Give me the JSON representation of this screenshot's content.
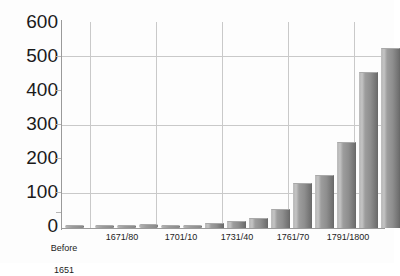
{
  "chart_data": {
    "type": "bar",
    "title": "",
    "subtitle": "",
    "xlabel": "",
    "ylabel": "",
    "ylim": [
      0,
      600
    ],
    "ytick_labels": [
      "0",
      "100",
      "200",
      "300",
      "400",
      "500",
      "600"
    ],
    "ytick_values": [
      0,
      100,
      200,
      300,
      400,
      500,
      600
    ],
    "grid": "horizontal-major-and-vertical-group-separators",
    "legend": "none",
    "categories": [
      "Before 1651",
      "",
      "1671/80",
      "",
      "",
      "1701/10",
      "",
      "",
      "1731/40",
      "",
      "",
      "1761/70",
      "",
      "",
      "1791/1800"
    ],
    "group_labels": [
      "Before\n1651",
      "1671/80",
      "1701/10",
      "1731/40",
      "1761/70",
      "1791/1800"
    ],
    "values": [
      5,
      8,
      10,
      12,
      8,
      10,
      15,
      20,
      30,
      55,
      130,
      155,
      250,
      455,
      525
    ],
    "bars": [
      {
        "label": "Before 1651",
        "value": 5
      },
      {
        "label": "1661/70",
        "value": 8
      },
      {
        "label": "1671/80",
        "value": 10
      },
      {
        "label": "1681/90",
        "value": 12
      },
      {
        "label": "1691/1700",
        "value": 8
      },
      {
        "label": "1701/10",
        "value": 10
      },
      {
        "label": "1711/20",
        "value": 15
      },
      {
        "label": "1721/30",
        "value": 20
      },
      {
        "label": "1731/40",
        "value": 30
      },
      {
        "label": "1741/50",
        "value": 55
      },
      {
        "label": "1751/60",
        "value": 130
      },
      {
        "label": "1761/70",
        "value": 155
      },
      {
        "label": "1771/80",
        "value": 250
      },
      {
        "label": "1781/90",
        "value": 455
      },
      {
        "label": "1791/1800",
        "value": 525
      }
    ],
    "bar_color": "#8e8e8e",
    "bar_highlight_color": "#c4c4c4",
    "bar_shadow_color": "#6e6e6e",
    "grid_color": "#c9c9c9",
    "axis_color": "#9a9a9a",
    "text_color": "#1a1a1a",
    "background_color": "#fdfdfd"
  },
  "y_axis": {
    "labels": [
      {
        "text": "600"
      },
      {
        "text": "500"
      },
      {
        "text": "400"
      },
      {
        "text": "300"
      },
      {
        "text": "200"
      },
      {
        "text": "100"
      },
      {
        "text": "0"
      }
    ]
  },
  "x_axis": {
    "labels": [
      {
        "line1": "Before",
        "line2": "1651"
      },
      {
        "line1": "1671/80",
        "line2": ""
      },
      {
        "line1": "1701/10",
        "line2": ""
      },
      {
        "line1": "1731/40",
        "line2": ""
      },
      {
        "line1": "1761/70",
        "line2": ""
      },
      {
        "line1": "1791/1800",
        "line2": ""
      }
    ]
  }
}
